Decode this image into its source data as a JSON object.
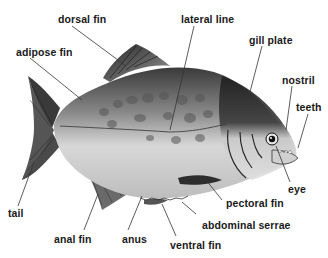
{
  "diagram": {
    "labels": {
      "dorsal_fin": "dorsal fin",
      "lateral_line": "lateral line",
      "gill_plate": "gill plate",
      "adipose_fin": "adipose fin",
      "nostril": "nostril",
      "teeth": "teeth",
      "eye": "eye",
      "tail": "tail",
      "pectoral_fin": "pectoral fin",
      "abdominal_serrae": "abdominal serrae",
      "anal_fin": "anal fin",
      "anus": "anus",
      "ventral_fin": "ventral fin"
    },
    "colors": {
      "background": "#ffffff",
      "label_text": "#1a1a1a",
      "leader_line": "#333333",
      "body_light": "#d9d9d9",
      "body_dark": "#2a2a2a"
    }
  }
}
